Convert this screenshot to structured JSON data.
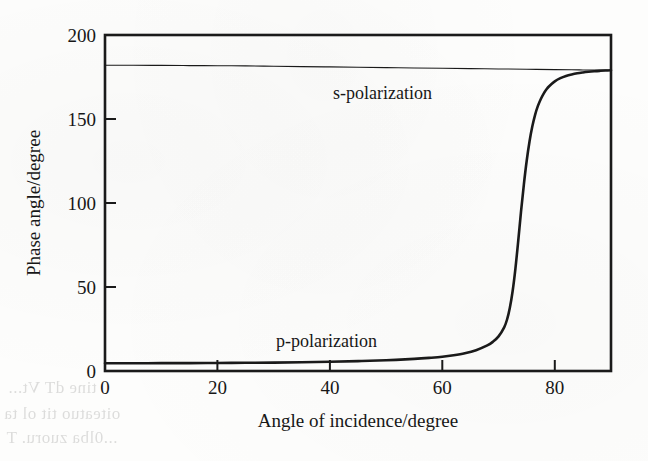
{
  "chart_data": {
    "type": "line",
    "title": "",
    "xlabel": "Angle of incidence/degree",
    "ylabel": "Phase angle/degree",
    "xlim": [
      0,
      90
    ],
    "ylim": [
      0,
      200
    ],
    "xticks": [
      0,
      20,
      40,
      60,
      80
    ],
    "yticks": [
      0,
      50,
      100,
      150,
      200
    ],
    "xticklabels": [
      "0",
      "20",
      "40",
      "60",
      "80"
    ],
    "yticklabels": [
      "0",
      "50",
      "100",
      "150",
      "200"
    ],
    "grid": false,
    "legend_position": "inline-annotations",
    "frame": "box",
    "annotations": [
      {
        "text": "s-polarization",
        "x": 43,
        "y": 160
      },
      {
        "text": "p-polarization",
        "x": 28,
        "y": 28
      }
    ],
    "series": [
      {
        "name": "s-polarization",
        "label": "s-polarization",
        "color": "#1a1a1a",
        "linewidth": 1.1,
        "x": [
          0,
          5,
          10,
          15,
          20,
          25,
          30,
          35,
          40,
          45,
          50,
          55,
          60,
          65,
          70,
          75,
          80,
          83,
          85,
          87,
          88,
          89,
          89.5,
          90
        ],
        "y": [
          182.0,
          182.0,
          181.9,
          181.8,
          181.7,
          181.6,
          181.4,
          181.2,
          181.0,
          180.8,
          180.6,
          180.4,
          180.2,
          180.0,
          179.8,
          179.6,
          179.4,
          179.3,
          179.2,
          179.15,
          179.1,
          179.1,
          179.05,
          179.0
        ]
      },
      {
        "name": "p-polarization",
        "label": "p-polarization",
        "color": "#1a1a1a",
        "linewidth": 2.6,
        "brewster_angle": 75.5,
        "x": [
          0,
          5,
          10,
          15,
          20,
          25,
          30,
          35,
          40,
          45,
          50,
          55,
          58,
          60,
          62,
          64,
          66,
          68,
          69,
          70,
          71,
          71.5,
          72,
          72.5,
          73,
          73.5,
          74,
          74.5,
          75,
          75.5,
          76,
          76.5,
          77,
          77.5,
          78,
          78.5,
          79,
          80,
          81,
          82,
          83,
          84,
          85,
          86,
          87,
          88,
          89,
          90
        ],
        "y": [
          4.6,
          4.6,
          4.7,
          4.7,
          4.8,
          4.9,
          5.0,
          5.2,
          5.5,
          5.9,
          6.4,
          7.2,
          7.9,
          8.5,
          9.4,
          10.6,
          12.4,
          15.2,
          17.4,
          20.6,
          26.0,
          30.5,
          37.5,
          47.5,
          61.0,
          77.5,
          95.0,
          111.0,
          125.0,
          136.5,
          145.5,
          152.5,
          157.8,
          161.8,
          165.0,
          167.5,
          169.5,
          172.4,
          174.3,
          175.6,
          176.5,
          177.2,
          177.7,
          178.1,
          178.4,
          178.65,
          178.85,
          179.0
        ]
      }
    ]
  },
  "figure": {
    "background_color": "#fdfdfc",
    "ink_color": "#1a1a1a",
    "plot_box": {
      "left": 105,
      "top": 35,
      "right": 611,
      "bottom": 371
    }
  },
  "bleed_through": [
    {
      "text": "tine  dT  Vt..."
    },
    {
      "text": "oiteatuo  tit ol ta"
    },
    {
      "text": "...0lba zuoru.  T"
    }
  ]
}
